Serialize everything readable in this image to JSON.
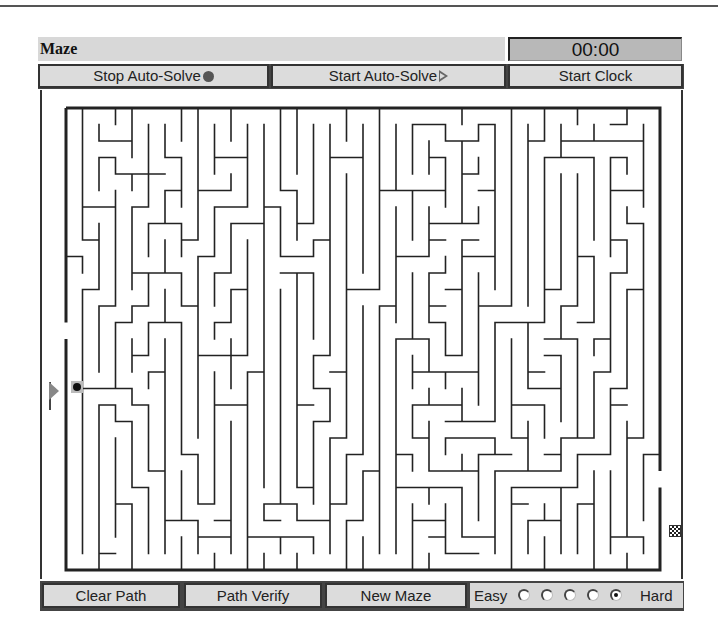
{
  "app": {
    "title": "Maze",
    "timer": "00:00"
  },
  "toolbar": {
    "stop_auto_solve_label": "Stop Auto-Solve",
    "stop_auto_solve_icon": "filled-circle-icon",
    "start_auto_solve_label": "Start Auto-Solve",
    "start_auto_solve_icon": "play-triangle-icon",
    "start_clock_label": "Start Clock"
  },
  "maze": {
    "cols": 36,
    "rows": 28,
    "cell_px": 16.5,
    "origin_x": 24,
    "origin_y": 18,
    "wall_color": "#222222",
    "start": {
      "row": 13,
      "col": 0,
      "marker": "start-arrow-icon"
    },
    "player": {
      "row": 13,
      "col": 0,
      "marker": "player-ball-icon"
    },
    "goal": {
      "row": 22,
      "col": 35,
      "marker": "checkered-flag-icon"
    },
    "seed": 20240607
  },
  "bottom": {
    "clear_path_label": "Clear Path",
    "path_verify_label": "Path Verify",
    "new_maze_label": "New Maze",
    "difficulty": {
      "easy_label": "Easy",
      "hard_label": "Hard",
      "levels": 5,
      "selected": 5
    }
  }
}
